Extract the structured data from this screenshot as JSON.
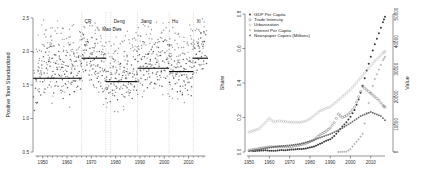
{
  "figure": {
    "panels": [
      "left-scatter-panel",
      "right-series-panel"
    ],
    "background": "#ffffff"
  },
  "chart_data": [
    {
      "id": "left",
      "type": "scatter",
      "title": "",
      "xlabel": "",
      "ylabel": "Positive Tone Standardized",
      "xlim": [
        1946,
        2018
      ],
      "ylim": [
        0.5,
        2.5
      ],
      "xticks": [
        1950,
        1960,
        1970,
        1980,
        1990,
        2000,
        2010
      ],
      "yticks": [
        0.5,
        1.0,
        1.5,
        2.0,
        2.5
      ],
      "grid": false,
      "legend_position": "none",
      "point_color": "#333333",
      "mean_line_color": "#000000",
      "event_line_color": "#b9b9b9",
      "annotations": [
        {
          "label": "CR",
          "x": 1966,
          "label_y": 2.42
        },
        {
          "label": "Mao Dies",
          "x": 1976,
          "label_y": 2.3
        },
        {
          "label": "Deng",
          "x": 1978,
          "label_y": 2.42
        },
        {
          "label": "Jiang",
          "x": 1989,
          "label_y": 2.42
        },
        {
          "label": "Hu",
          "x": 2002,
          "label_y": 2.42
        },
        {
          "label": "Xi",
          "x": 2012,
          "label_y": 2.42
        }
      ],
      "event_lines": [
        1966,
        1976,
        1978,
        1989,
        2002,
        2012
      ],
      "mean_segments": [
        {
          "x0": 1946,
          "x1": 1966,
          "y": 1.6
        },
        {
          "x0": 1966,
          "x1": 1976,
          "y": 1.9
        },
        {
          "x0": 1976,
          "x1": 1978,
          "y": 1.55
        },
        {
          "x0": 1978,
          "x1": 1989,
          "y": 1.55
        },
        {
          "x0": 1989,
          "x1": 2002,
          "y": 1.75
        },
        {
          "x0": 2002,
          "x1": 2012,
          "y": 1.7
        },
        {
          "x0": 2012,
          "x1": 2018,
          "y": 1.9
        }
      ],
      "series": [
        {
          "name": "Positive Tone Standardized",
          "x": [
            1946.2,
            1946.6,
            1947.0,
            1947.3,
            1947.7,
            1948.1,
            1948.5,
            1948.9,
            1949.2,
            1949.6,
            1950.0,
            1950.3,
            1950.6,
            1950.9,
            1951.2,
            1951.5,
            1951.8,
            1952.1,
            1952.4,
            1952.7,
            1953.0,
            1953.3,
            1953.6,
            1953.9,
            1954.2,
            1954.5,
            1954.8,
            1955.1,
            1955.4,
            1955.7,
            1956.0,
            1956.3,
            1956.6,
            1956.9,
            1957.2,
            1957.5,
            1957.8,
            1958.1,
            1958.4,
            1958.7,
            1959.0,
            1959.3,
            1959.6,
            1959.9,
            1960.2,
            1960.5,
            1960.8,
            1961.1,
            1961.4,
            1961.7,
            1962.0,
            1962.3,
            1962.6,
            1962.9,
            1963.2,
            1963.5,
            1963.8,
            1964.1,
            1964.4,
            1964.7,
            1965.0,
            1965.3,
            1965.6,
            1965.9,
            1966.1,
            1966.4,
            1966.7,
            1967.0,
            1967.3,
            1967.6,
            1967.9,
            1968.2,
            1968.5,
            1968.8,
            1969.1,
            1969.4,
            1969.7,
            1970.0,
            1970.3,
            1970.6,
            1970.9,
            1971.2,
            1971.5,
            1971.8,
            1972.1,
            1972.4,
            1972.7,
            1973.0,
            1973.3,
            1973.6,
            1973.9,
            1974.2,
            1974.5,
            1974.8,
            1975.1,
            1975.4,
            1975.7,
            1976.0,
            1976.3,
            1976.6,
            1976.9,
            1977.2,
            1977.5,
            1977.8,
            1978.1,
            1978.4,
            1978.7,
            1979.0,
            1979.3,
            1979.6,
            1979.9,
            1980.2,
            1980.5,
            1980.8,
            1981.1,
            1981.4,
            1981.7,
            1982.0,
            1982.3,
            1982.6,
            1982.9,
            1983.2,
            1983.5,
            1983.8,
            1984.1,
            1984.4,
            1984.7,
            1985.0,
            1985.3,
            1985.6,
            1985.9,
            1986.2,
            1986.5,
            1986.8,
            1987.1,
            1987.4,
            1987.7,
            1988.0,
            1988.3,
            1988.6,
            1988.9,
            1989.2,
            1989.5,
            1989.8,
            1990.1,
            1990.4,
            1990.7,
            1991.0,
            1991.3,
            1991.6,
            1991.9,
            1992.2,
            1992.5,
            1992.8,
            1993.1,
            1993.4,
            1993.7,
            1994.0,
            1994.3,
            1994.6,
            1994.9,
            1995.2,
            1995.5,
            1995.8,
            1996.1,
            1996.4,
            1996.7,
            1997.0,
            1997.3,
            1997.6,
            1997.9,
            1998.2,
            1998.5,
            1998.8,
            1999.1,
            1999.4,
            1999.7,
            2000.0,
            2000.3,
            2000.6,
            2000.9,
            2001.2,
            2001.5,
            2001.8,
            2002.1,
            2002.4,
            2002.7,
            2003.0,
            2003.3,
            2003.6,
            2003.9,
            2004.2,
            2004.5,
            2004.8,
            2005.1,
            2005.4,
            2005.7,
            2006.0,
            2006.3,
            2006.6,
            2006.9,
            2007.2,
            2007.5,
            2007.8,
            2008.1,
            2008.4,
            2008.7,
            2009.0,
            2009.3,
            2009.6,
            2009.9,
            2010.2,
            2010.5,
            2010.8,
            2011.1,
            2011.4,
            2011.7,
            2012.0,
            2012.3,
            2012.6,
            2012.9,
            2013.2,
            2013.5,
            2013.8,
            2014.1,
            2014.4,
            2014.7,
            2015.0,
            2015.3,
            2015.6,
            2015.9,
            2016.2,
            2016.5,
            2016.8,
            2017.1,
            2017.4
          ],
          "y": [
            1.32,
            1.12,
            1.45,
            1.58,
            1.24,
            1.71,
            1.4,
            1.62,
            1.35,
            1.8,
            1.55,
            1.92,
            1.68,
            1.44,
            1.99,
            1.75,
            2.05,
            1.6,
            1.85,
            1.5,
            1.78,
            2.08,
            1.62,
            1.9,
            1.7,
            1.38,
            1.95,
            1.66,
            1.82,
            1.55,
            1.73,
            1.48,
            2.0,
            1.64,
            1.88,
            1.42,
            1.76,
            1.58,
            1.3,
            1.84,
            1.66,
            1.52,
            1.94,
            1.7,
            1.46,
            1.78,
            1.6,
            1.36,
            1.88,
            1.68,
            1.54,
            1.8,
            1.62,
            1.4,
            1.74,
            1.56,
            1.86,
            1.64,
            1.48,
            1.92,
            1.7,
            1.58,
            1.44,
            1.82,
            2.18,
            1.95,
            2.25,
            1.88,
            2.1,
            1.72,
            2.02,
            1.8,
            2.15,
            1.9,
            1.65,
            2.05,
            1.85,
            1.58,
            1.96,
            1.74,
            1.5,
            1.88,
            2.12,
            1.7,
            1.92,
            1.6,
            1.8,
            1.55,
            2.0,
            1.76,
            1.48,
            1.86,
            1.64,
            1.4,
            1.95,
            1.72,
            1.56,
            1.3,
            1.62,
            1.44,
            1.7,
            1.38,
            1.58,
            1.25,
            1.52,
            1.66,
            1.42,
            1.78,
            1.55,
            1.34,
            1.6,
            1.48,
            1.72,
            1.28,
            1.56,
            1.66,
            1.44,
            1.82,
            1.58,
            1.36,
            1.64,
            1.5,
            1.76,
            1.32,
            1.6,
            1.7,
            1.46,
            1.86,
            1.54,
            1.38,
            1.68,
            1.52,
            1.8,
            1.3,
            1.62,
            1.74,
            1.48,
            1.88,
            1.56,
            1.42,
            1.66,
            1.85,
            1.55,
            1.95,
            1.72,
            1.6,
            1.88,
            1.5,
            1.78,
            1.65,
            1.92,
            1.58,
            1.82,
            1.7,
            1.46,
            1.96,
            1.74,
            1.62,
            1.88,
            1.54,
            1.8,
            1.68,
            2.0,
            1.76,
            1.52,
            1.9,
            1.66,
            1.84,
            1.58,
            2.06,
            1.78,
            1.64,
            1.94,
            1.7,
            1.48,
            1.86,
            2.15,
            1.72,
            1.98,
            1.6,
            1.88,
            1.76,
            2.1,
            1.82,
            1.54,
            1.92,
            1.68,
            1.8,
            1.44,
            1.72,
            1.6,
            1.86,
            1.52,
            1.76,
            1.66,
            1.4,
            1.84,
            1.58,
            1.7,
            1.48,
            1.78,
            1.64,
            1.36,
            1.88,
            1.56,
            1.74,
            1.5,
            1.82,
            1.62,
            1.42,
            1.7,
            1.54,
            1.86,
            1.6,
            1.34,
            1.76,
            1.66,
            1.9,
            1.78,
            2.05,
            1.84,
            1.96,
            1.72,
            2.12,
            1.88,
            2.0,
            1.8,
            2.2,
            1.92,
            1.74,
            2.08,
            1.86,
            2.15,
            1.94,
            2.25,
            1.82
          ]
        }
      ]
    },
    {
      "id": "right",
      "type": "scatter",
      "title": "",
      "xlabel": "",
      "ylabel": "Share",
      "y2label": "Value",
      "xlim": [
        1948,
        2018
      ],
      "ylim": [
        0,
        0.8
      ],
      "y2lim": [
        0,
        50000
      ],
      "xticks": [
        1950,
        1960,
        1970,
        1980,
        1990,
        2000,
        2010
      ],
      "yticks": [
        0.0,
        0.2,
        0.4,
        0.6,
        0.8
      ],
      "y2ticks": [
        0,
        10000,
        20000,
        30000,
        40000,
        50000
      ],
      "grid": false,
      "legend_position": "top-left",
      "series": [
        {
          "name": "GDP Per Capita",
          "color": "#3a3a3a",
          "marker": "filled-circle",
          "axis": "right",
          "x": [
            1952,
            1954,
            1956,
            1958,
            1960,
            1962,
            1964,
            1966,
            1968,
            1970,
            1972,
            1974,
            1976,
            1978,
            1980,
            1982,
            1984,
            1986,
            1988,
            1990,
            1992,
            1994,
            1996,
            1998,
            2000,
            2002,
            2004,
            2006,
            2008,
            2010,
            2012,
            2014,
            2016,
            2017
          ],
          "values": [
            350,
            420,
            520,
            600,
            480,
            420,
            560,
            700,
            650,
            800,
            950,
            1050,
            1100,
            1300,
            1600,
            2000,
            2600,
            3300,
            4100,
            4600,
            5800,
            7400,
            9200,
            10800,
            12800,
            15200,
            19000,
            24000,
            29500,
            34500,
            39000,
            43000,
            47000,
            49000
          ]
        },
        {
          "name": "Trade Intensity",
          "color": "#777777",
          "marker": "open-circle",
          "axis": "left",
          "x": [
            1950,
            1955,
            1960,
            1965,
            1970,
            1975,
            1978,
            1980,
            1982,
            1985,
            1988,
            1990,
            1992,
            1994,
            1996,
            1998,
            2000,
            2002,
            2004,
            2006,
            2008,
            2010,
            2012,
            2014,
            2016,
            2017
          ],
          "values": [
            0.01,
            0.02,
            0.03,
            0.03,
            0.03,
            0.04,
            0.05,
            0.06,
            0.07,
            0.1,
            0.12,
            0.14,
            0.17,
            0.22,
            0.2,
            0.21,
            0.23,
            0.26,
            0.32,
            0.38,
            0.36,
            0.34,
            0.32,
            0.3,
            0.27,
            0.26
          ]
        },
        {
          "name": "Urbanization",
          "color": "#bbbbbb",
          "marker": "open-circle",
          "axis": "left",
          "x": [
            1950,
            1955,
            1960,
            1962,
            1965,
            1970,
            1975,
            1978,
            1980,
            1985,
            1990,
            1995,
            2000,
            2005,
            2010,
            2012,
            2014,
            2016,
            2017
          ],
          "values": [
            0.115,
            0.135,
            0.195,
            0.175,
            0.18,
            0.173,
            0.172,
            0.179,
            0.192,
            0.238,
            0.262,
            0.31,
            0.362,
            0.43,
            0.5,
            0.527,
            0.549,
            0.573,
            0.583
          ]
        },
        {
          "name": "Internet Per Capita",
          "color": "#8f8f8f",
          "marker": "plus",
          "axis": "left",
          "x": [
            1994,
            1996,
            1998,
            2000,
            2002,
            2004,
            2006,
            2008,
            2010,
            2012,
            2014,
            2016,
            2017
          ],
          "values": [
            0.0,
            0.001,
            0.002,
            0.017,
            0.046,
            0.073,
            0.105,
            0.226,
            0.343,
            0.423,
            0.478,
            0.532,
            0.552
          ]
        },
        {
          "name": "Newspaper Copies (Millions)",
          "color": "#666666",
          "marker": "small-square",
          "axis": "right",
          "x": [
            1950,
            1955,
            1960,
            1965,
            1970,
            1975,
            1980,
            1985,
            1990,
            1995,
            2000,
            2005,
            2010,
            2015,
            2017
          ],
          "values": [
            300,
            900,
            1600,
            2100,
            2400,
            2900,
            3800,
            5200,
            6500,
            8200,
            10500,
            13000,
            14500,
            13000,
            11500
          ]
        }
      ]
    }
  ]
}
